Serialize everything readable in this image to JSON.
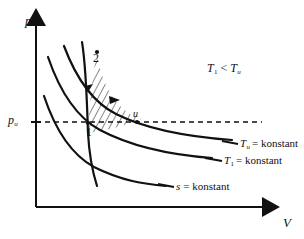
{
  "figure": {
    "type": "thermodynamic-pv-diagram",
    "background": "#ffffff",
    "stroke_color": "#111111",
    "axes": {
      "y_label": "p",
      "x_label": "V",
      "y_axis_name": "pressure-axis",
      "x_axis_name": "volume-axis",
      "tick_label": "p",
      "tick_sub": "u"
    },
    "annotation": {
      "t1": "T",
      "t1_sub": "1",
      "relation": "<",
      "tu": "T",
      "tu_sub": "u"
    },
    "points": [
      {
        "name": "point-2",
        "label": "2",
        "x": 93,
        "y": 61
      },
      {
        "name": "point-1",
        "label": "1",
        "x": 88,
        "y": 133
      },
      {
        "name": "point-u",
        "label": "u",
        "x": 133,
        "y": 116
      }
    ],
    "curve_labels": [
      {
        "name": "tu-isotherm-label",
        "sym": "T",
        "sub": "u",
        "sub_italic": true,
        "text": "= konstant"
      },
      {
        "name": "t1-isotherm-label",
        "sym": "T",
        "sub": "1",
        "sub_italic": false,
        "text": "= konstant"
      },
      {
        "name": "isentrope-label",
        "sym": "s",
        "sub": "",
        "sub_italic": false,
        "text": "= konstant"
      }
    ],
    "curves": {
      "tu_isotherm": "Tu = konstant",
      "t1_isotherm": "T1 = konstant",
      "isentrope_lower": "s = konstant",
      "isentrope_through_1_2": "s = konstant (steep)"
    },
    "hatched_region": {
      "name": "work-area-hatching",
      "description": "hatched area between isentrope and isotherm bounded by points 1, 2, u"
    },
    "dashed_line": {
      "name": "pu-dashed-line",
      "description": "horizontal dashed line at p_u"
    }
  }
}
